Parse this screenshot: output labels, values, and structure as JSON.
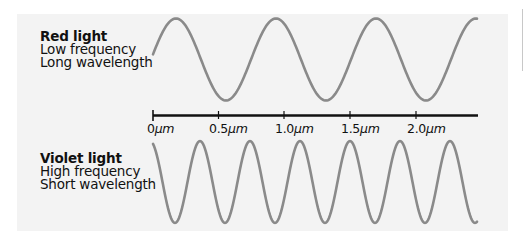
{
  "red_light": {
    "title": "Red light",
    "line1": "Low frequency",
    "line2": "Long wavelength",
    "wave_color": "#8a8a8a",
    "period_px": 100,
    "wavelength_um": 0.76
  },
  "violet_light": {
    "title": "Violet light",
    "line1": "High frequency",
    "line2": "Short wavelength",
    "wave_color": "#8a8a8a",
    "period_px": 50,
    "wavelength_um": 0.38
  },
  "axis": {
    "color": "#111111",
    "ticks": [
      {
        "value": "0",
        "unit": "μm"
      },
      {
        "value": "0.5",
        "unit": "μm"
      },
      {
        "value": "1.0",
        "unit": "μm"
      },
      {
        "value": "1.5",
        "unit": "μm"
      },
      {
        "value": "2.0",
        "unit": "μm"
      }
    ]
  },
  "colors": {
    "panel_background": "#f3f3f3",
    "page_background": "#ffffff",
    "text": "#111111"
  }
}
